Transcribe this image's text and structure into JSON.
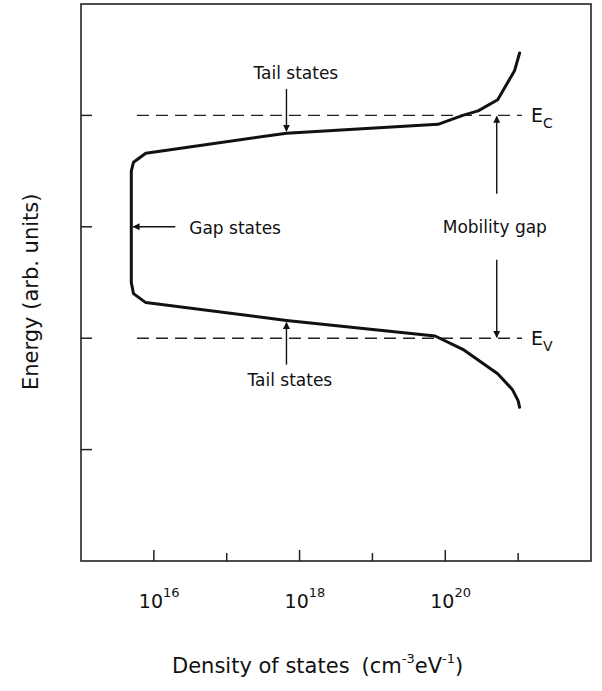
{
  "chart_data": {
    "type": "line",
    "title": "",
    "xlabel": "Density of states",
    "xlabel_unit_base": "cm",
    "xlabel_unit_exp1": "-3",
    "xlabel_unit_mid": "eV",
    "xlabel_unit_exp2": "-1",
    "ylabel": "Energy (arb. units)",
    "xscale": "log10",
    "xlim_log10": [
      15,
      22
    ],
    "ylim": [
      -1.0,
      1.5
    ],
    "grid": false,
    "x_ticks_log10": [
      16,
      17,
      18,
      19,
      20,
      21
    ],
    "x_tick_labels": [
      {
        "at_log10": 16,
        "base": "10",
        "exp": "16"
      },
      {
        "at_log10": 18,
        "base": "10",
        "exp": "18"
      },
      {
        "at_log10": 20,
        "base": "10",
        "exp": "20"
      }
    ],
    "y_ticks": [
      1.0,
      0.5,
      0.0,
      -0.5
    ],
    "reference_lines": [
      {
        "name": "Ec",
        "label_main": "E",
        "label_sub": "C",
        "energy": 1.0
      },
      {
        "name": "Ev",
        "label_main": "E",
        "label_sub": "V",
        "energy": 0.0
      }
    ],
    "series": [
      {
        "name": "Density of states",
        "points_log10N_E": [
          [
            21.02,
            1.28
          ],
          [
            20.95,
            1.2
          ],
          [
            20.72,
            1.07
          ],
          [
            20.45,
            1.02
          ],
          [
            20.24,
            1.0
          ],
          [
            19.9,
            0.96
          ],
          [
            17.82,
            0.92
          ],
          [
            15.89,
            0.83
          ],
          [
            15.72,
            0.79
          ],
          [
            15.69,
            0.75
          ],
          [
            15.69,
            0.25
          ],
          [
            15.72,
            0.2
          ],
          [
            15.89,
            0.16
          ],
          [
            17.82,
            0.08
          ],
          [
            19.86,
            0.01
          ],
          [
            20.24,
            -0.05
          ],
          [
            20.72,
            -0.16
          ],
          [
            20.92,
            -0.23
          ],
          [
            21.0,
            -0.28
          ],
          [
            21.02,
            -0.31
          ]
        ]
      }
    ],
    "annotations": [
      {
        "name": "tail-states-upper",
        "text": "Tail states",
        "arrow_to_log10N": 17.82,
        "arrow_to_E": 0.93,
        "direction": "down"
      },
      {
        "name": "tail-states-lower",
        "text": "Tail states",
        "arrow_to_log10N": 17.82,
        "arrow_to_E": 0.07,
        "direction": "up"
      },
      {
        "name": "gap-states",
        "text": "Gap states",
        "arrow_to_log10N": 15.69,
        "arrow_to_E": 0.5,
        "direction": "left"
      },
      {
        "name": "mobility-gap",
        "text": "Mobility gap",
        "from_E": 1.0,
        "to_E": 0.0,
        "at_log10N": 20.72
      }
    ]
  }
}
